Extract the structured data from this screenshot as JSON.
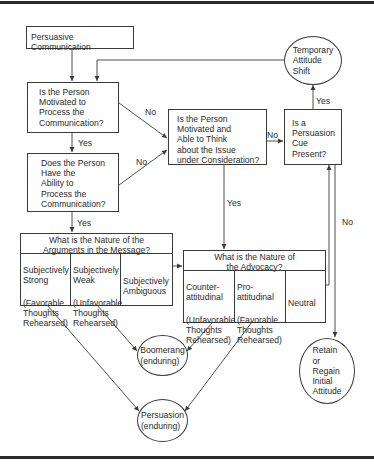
{
  "diagram": {
    "start": {
      "label": "Persuasive Communication"
    },
    "q_motivation": {
      "label": "Is the Person\nMotivated to\nProcess the\nCommunication?"
    },
    "q_ability": {
      "label": "Does the Person\nHave the\nAbility to\nProcess the\nCommunication?"
    },
    "q_think": {
      "label": "Is the Person\nMotivated and\nAble to Think\nabout the Issue\nunder Consideration?"
    },
    "q_cue": {
      "label": "Is a\nPersuasion\nCue\nPresent?"
    },
    "temporary_shift": {
      "label": "Temporary\nAttitude\nShift"
    },
    "arguments": {
      "header": "What is the Nature of the\nArguments in the Message?",
      "columns": [
        {
          "title": "Subjectively\nStrong",
          "sub": "(Favorable\nThoughts\nRehearsed)"
        },
        {
          "title": "Subjectively\nWeak",
          "sub": "(Unfavorable\nThoughts\nRehearsed)"
        },
        {
          "title": "Subjectively\nAmbiguous",
          "sub": ""
        }
      ]
    },
    "advocacy": {
      "header": "What is the Nature of\nthe Advocacy?",
      "columns": [
        {
          "title": "Counter-\nattitudinal",
          "sub": "(Unfavorable\nThoughts\nRehearsed)"
        },
        {
          "title": "Pro-\nattitudinal",
          "sub": "(Favorable\nThoughts\nRehearsed)"
        },
        {
          "title": "Neutral",
          "sub": ""
        }
      ]
    },
    "boomerang": {
      "label": "Boomerang\n(enduring)"
    },
    "persuasion": {
      "label": "Persuasion\n(enduring)"
    },
    "retain": {
      "label": "Retain\nor\nRegain\nInitial\nAttitude"
    },
    "edge_labels": {
      "motivation_no": "No",
      "motivation_yes": "Yes",
      "ability_no": "No",
      "ability_yes": "Yes",
      "think_no": "No",
      "think_yes": "Yes",
      "cue_yes": "Yes",
      "cue_no": "No"
    },
    "colors": {
      "line": "#3a3a3a",
      "text": "#2a2a2a",
      "frame": "#2b2b2b",
      "background": "#ffffff"
    }
  }
}
